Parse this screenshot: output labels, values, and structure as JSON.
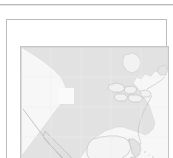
{
  "window": {
    "title": "",
    "background_color": "#ffffff"
  },
  "separator": {
    "name": "top-divider",
    "color": "#b9b9b9",
    "shadow_color": "#e7e7e7"
  },
  "panel": {
    "border_color": "#bcbcbc",
    "inner_border_color": "#c6c6c6",
    "label": ""
  },
  "map": {
    "name": "north-america-locator-map",
    "state": "disabled",
    "land_color": "#e2e2e2",
    "water_color": "#f7f7f7",
    "coastline_color": "#c9c9c9",
    "background_color": "#f2f2f2",
    "regions": [
      "Canada",
      "Hudson Bay",
      "Great Lakes",
      "United States",
      "Florida",
      "Gulf of Mexico",
      "Mexico",
      "Baja California",
      "Central America",
      "Cuba",
      "Hispaniola",
      "Caribbean Sea",
      "Atlantic Ocean",
      "Pacific Ocean"
    ],
    "alt_text": "Grayed out locator map of North America"
  },
  "selection": {
    "name": "viewport-highlight",
    "color": "#fafafa",
    "x": 37,
    "y": 41,
    "width": 16,
    "height": 16,
    "label": ""
  }
}
